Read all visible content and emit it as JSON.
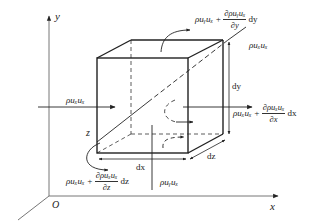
{
  "diagram": {
    "type": "control-volume momentum flux diagram",
    "axes": {
      "x_label": "x",
      "y_label": "y",
      "z_label": "z",
      "origin_label": "O"
    },
    "dimensions": {
      "dx_label": "dx",
      "dy_label": "dy",
      "dz_label": "dz"
    },
    "fluxes": {
      "x_in": "ρuₓuₓ",
      "x_out_base": "ρuₓuₓ +",
      "x_out_num": "∂ρuₓuₓ",
      "x_out_den": "∂x",
      "x_out_diff": "dx",
      "y_in": "ρuᵧuₓ",
      "y_out_base": "ρuᵧuₓ +",
      "y_out_num": "∂ρuᵧuₓ",
      "y_out_den": "∂y",
      "y_out_diff": "dy",
      "z_in": "ρuₓuₓ",
      "z_out_base": "ρuₓuₓ +",
      "z_out_num": "∂ρuₓuₓ",
      "z_out_den": "∂z",
      "z_out_diff": "dz"
    },
    "colors": {
      "line": "#222222",
      "axis": "#555555",
      "background": "#ffffff"
    }
  }
}
